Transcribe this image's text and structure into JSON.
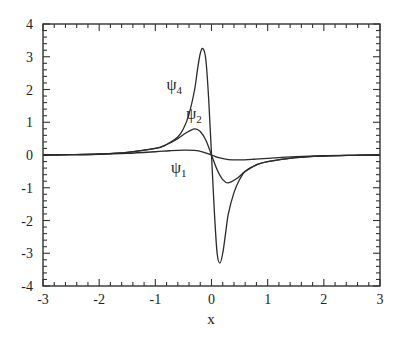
{
  "chart_data": {
    "type": "line",
    "title": "",
    "xlabel": "x",
    "ylabel": "",
    "xlim": [
      -3,
      3
    ],
    "ylim": [
      -4,
      4
    ],
    "grid": false,
    "legend": "none (inline annotations)",
    "xticks": [
      -3,
      -2,
      -1,
      0,
      1,
      2,
      3
    ],
    "yticks": [
      -4,
      -3,
      -2,
      -1,
      0,
      1,
      2,
      3,
      4
    ],
    "xtick_labels": [
      "-3",
      "-2",
      "-1",
      "0",
      "1",
      "2",
      "3"
    ],
    "ytick_labels": [
      "-4",
      "-3",
      "-2",
      "-1",
      "0",
      "1",
      "2",
      "3",
      "4"
    ],
    "series": [
      {
        "name": "ψ1",
        "label_main": "ψ",
        "label_sub": "1",
        "x": [
          -3,
          -2.5,
          -2,
          -1.5,
          -1,
          -0.75,
          -0.5,
          -0.3,
          -0.15,
          0,
          0.15,
          0.3,
          0.5,
          0.75,
          1,
          1.5,
          2,
          2.5,
          3
        ],
        "y": [
          0.0,
          0.01,
          0.02,
          0.05,
          0.1,
          0.13,
          0.15,
          0.14,
          0.09,
          0.0,
          -0.09,
          -0.14,
          -0.15,
          -0.13,
          -0.1,
          -0.05,
          -0.02,
          -0.01,
          0.0
        ]
      },
      {
        "name": "ψ2",
        "label_main": "ψ",
        "label_sub": "2",
        "x": [
          -3,
          -2.5,
          -2,
          -1.5,
          -1,
          -0.8,
          -0.6,
          -0.45,
          -0.3,
          -0.2,
          -0.1,
          0,
          0.1,
          0.2,
          0.3,
          0.45,
          0.6,
          0.8,
          1,
          1.5,
          2,
          2.5,
          3
        ],
        "y": [
          0.0,
          0.01,
          0.03,
          0.08,
          0.2,
          0.32,
          0.5,
          0.68,
          0.8,
          0.72,
          0.45,
          0.0,
          -0.45,
          -0.75,
          -0.85,
          -0.72,
          -0.5,
          -0.3,
          -0.2,
          -0.08,
          -0.03,
          -0.01,
          0.0
        ]
      },
      {
        "name": "ψ4",
        "label_main": "ψ",
        "label_sub": "4",
        "x": [
          -3,
          -2.5,
          -2,
          -1.5,
          -1,
          -0.8,
          -0.6,
          -0.5,
          -0.4,
          -0.3,
          -0.25,
          -0.2,
          -0.15,
          -0.1,
          -0.05,
          0,
          0.05,
          0.1,
          0.15,
          0.2,
          0.25,
          0.3,
          0.4,
          0.5,
          0.6,
          0.8,
          1,
          1.5,
          2,
          2.5,
          3
        ],
        "y": [
          0.0,
          0.01,
          0.03,
          0.08,
          0.2,
          0.32,
          0.55,
          0.8,
          1.25,
          2.0,
          2.6,
          3.1,
          3.25,
          2.9,
          1.7,
          0.0,
          -1.7,
          -3.0,
          -3.3,
          -3.0,
          -2.4,
          -1.8,
          -1.15,
          -0.75,
          -0.5,
          -0.3,
          -0.2,
          -0.08,
          -0.03,
          -0.01,
          0.0
        ]
      }
    ],
    "annotations": [
      {
        "series": "ψ4",
        "x": -0.8,
        "y": 2.0
      },
      {
        "series": "ψ2",
        "x": -0.45,
        "y": 1.1
      },
      {
        "series": "ψ1",
        "x": -0.72,
        "y": -0.55
      }
    ]
  }
}
